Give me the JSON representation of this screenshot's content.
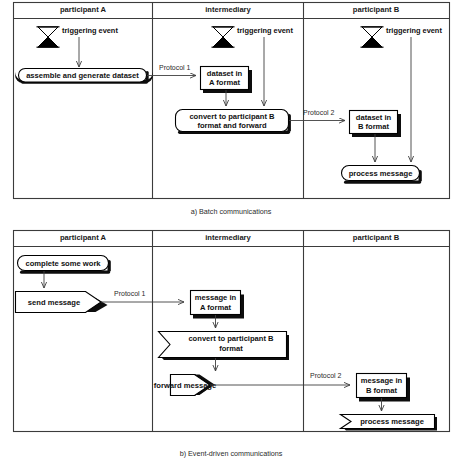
{
  "figure": {
    "title_a": "a) Batch communications",
    "title_b": "b) Event-driven communications"
  },
  "lanes": {
    "participant_a": "participant A",
    "intermediary": "intermediary",
    "participant_b": "participant B"
  },
  "diagram_a": {
    "caption": "a) Batch communications",
    "events": [
      {
        "label": "triggering event",
        "lane": "participant A"
      },
      {
        "label": "triggering event",
        "lane": "intermediary"
      },
      {
        "label": "triggering event",
        "lane": "participant B"
      }
    ],
    "nodes": [
      {
        "id": "assemble",
        "label": "assemble and generate dataset",
        "shape": "rounded",
        "lane": "participant A"
      },
      {
        "id": "dataset_a",
        "label_line1": "dataset in",
        "label_line2": "A format",
        "shape": "rect",
        "lane": "intermediary"
      },
      {
        "id": "convert",
        "label_line1": "convert to participant B",
        "label_line2": "format and forward",
        "shape": "rounded",
        "lane": "intermediary"
      },
      {
        "id": "dataset_b",
        "label_line1": "dataset in",
        "label_line2": "B format",
        "shape": "rect",
        "lane": "participant B"
      },
      {
        "id": "process",
        "label": "process message",
        "shape": "rounded",
        "lane": "participant B"
      }
    ],
    "protocols": [
      {
        "label": "Protocol 1",
        "from": "assemble",
        "to": "dataset_a"
      },
      {
        "label": "Protocol 2",
        "from": "convert",
        "to": "dataset_b"
      }
    ]
  },
  "diagram_b": {
    "caption": "b) Event-driven communications",
    "nodes": [
      {
        "id": "complete",
        "label": "complete some work",
        "shape": "rounded",
        "lane": "participant A"
      },
      {
        "id": "send",
        "label": "send message",
        "shape": "send-arrow",
        "lane": "participant A"
      },
      {
        "id": "message_a",
        "label_line1": "message in",
        "label_line2": "A format",
        "shape": "rect",
        "lane": "intermediary"
      },
      {
        "id": "convert_b",
        "label_line1": "convert to participant B",
        "label_line2": "format",
        "shape": "receive-arrow",
        "lane": "intermediary"
      },
      {
        "id": "forward",
        "label": "forward message",
        "shape": "send-arrow",
        "lane": "intermediary"
      },
      {
        "id": "message_b",
        "label_line1": "message in",
        "label_line2": "B format",
        "shape": "rect",
        "lane": "participant B"
      },
      {
        "id": "process_b",
        "label": "process message",
        "shape": "receive-arrow",
        "lane": "participant B"
      }
    ],
    "protocols": [
      {
        "label": "Protocol 1",
        "from": "send",
        "to": "message_a"
      },
      {
        "label": "Protocol 2",
        "from": "forward",
        "to": "message_b"
      }
    ]
  },
  "colors": {
    "stroke": "#000000",
    "frame": "#3b3b3b",
    "shadow": "#0d0d0d",
    "background": "#ffffff",
    "flow": "#3f3f3f"
  },
  "icons": {
    "triggering_event": "hourglass-icon"
  }
}
